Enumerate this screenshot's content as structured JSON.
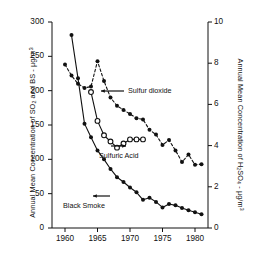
{
  "chart_data": {
    "type": "line",
    "title": "",
    "xlabel": "",
    "ylabel_left": "Annual Mean Concentration of SO2 and BS - µg/m3",
    "ylabel_right": "Annual Mean Concentration of H2SO4 - µg/m3",
    "xlim": [
      1958,
      1982
    ],
    "ylim_left": [
      0,
      300
    ],
    "ylim_right": [
      0,
      10
    ],
    "grid": false,
    "legend_position": "inline-annotations",
    "x_ticks": [
      "1960",
      "1965",
      "1970",
      "1975",
      "1980"
    ],
    "y_ticks_left": [
      "0",
      "50",
      "100",
      "150",
      "200",
      "250",
      "300"
    ],
    "y_ticks_right": [
      "0",
      "2",
      "4",
      "6",
      "8",
      "10"
    ],
    "series": [
      {
        "name": "Sulfur dioxide",
        "axis": "left",
        "marker": "filled-circle",
        "linestyle": "dashed",
        "x": [
          1960,
          1961,
          1962,
          1963,
          1964,
          1965,
          1966,
          1967,
          1968,
          1969,
          1970,
          1971,
          1972,
          1973,
          1974,
          1975,
          1976,
          1977,
          1978,
          1979,
          1980,
          1981
        ],
        "values": [
          238,
          222,
          210,
          204,
          206,
          243,
          214,
          190,
          178,
          172,
          166,
          160,
          158,
          143,
          136,
          121,
          128,
          113,
          96,
          107,
          92,
          93
        ]
      },
      {
        "name": "Sulfuric Acid",
        "axis": "right",
        "marker": "open-circle",
        "linestyle": "solid",
        "x": [
          1964,
          1965,
          1966,
          1967,
          1968,
          1969,
          1970,
          1971,
          1972
        ],
        "values": [
          6.6,
          5.2,
          4.5,
          4.2,
          3.9,
          4.1,
          4.3,
          4.3,
          4.3
        ]
      },
      {
        "name": "Black Smoke",
        "axis": "left",
        "marker": "filled-circle",
        "linestyle": "solid",
        "x": [
          1961,
          1962,
          1963,
          1964,
          1965,
          1966,
          1967,
          1968,
          1969,
          1970,
          1971,
          1972,
          1973,
          1974,
          1975,
          1976,
          1977,
          1978,
          1979,
          1980,
          1981
        ],
        "values": [
          281,
          218,
          152,
          132,
          113,
          100,
          86,
          74,
          67,
          59,
          52,
          41,
          44,
          38,
          30,
          35,
          33,
          29,
          26,
          23,
          20
        ]
      }
    ],
    "annotations": [
      {
        "text": "Sulfur dioxide",
        "points_to": "Sulfur dioxide"
      },
      {
        "text": "Sulfuric Acid",
        "points_to": "Sulfuric Acid"
      },
      {
        "text": "Black Smoke",
        "points_to": "Black Smoke"
      }
    ]
  },
  "axes": {
    "left_title_parts": {
      "pre": "Annual Mean Concentration of SO",
      "sub": "2",
      "mid": " and BS - µg/m",
      "sup": "3"
    },
    "right_title_parts": {
      "pre": "Annual Mean Concentration of H",
      "sub1": "2",
      "mid": "SO",
      "sub2": "4",
      "post": " - µg/m",
      "sup": "3"
    }
  },
  "labels": {
    "sulfur_dioxide": "Sulfur dioxide",
    "sulfuric_acid": "Sulfuric Acid",
    "black_smoke": "Black Smoke"
  },
  "colors": {
    "ink": "#111111",
    "background": "#ffffff"
  }
}
